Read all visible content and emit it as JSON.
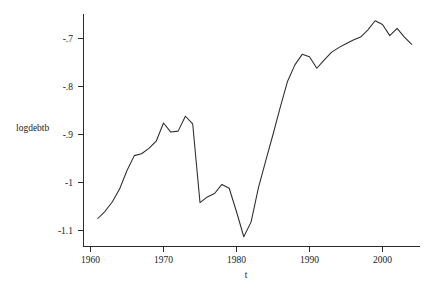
{
  "chart_data": {
    "type": "line",
    "title": "",
    "subtitle": "",
    "xlabel": "t",
    "ylabel": "logdebtb",
    "legend": [],
    "legend_position": "none",
    "grid": false,
    "xlim": [
      1960,
      2005
    ],
    "ylim": [
      -1.13,
      -0.655
    ],
    "xticks": [
      1960,
      1970,
      1980,
      1990,
      2000
    ],
    "xtick_labels": [
      "1960",
      "1970",
      "1980",
      "1990",
      "2000"
    ],
    "yticks": [
      -0.7,
      -0.8,
      -0.9,
      -1,
      -1.1
    ],
    "ytick_labels": [
      "-.7",
      "-.8",
      "-.9",
      "-1",
      "-1.1"
    ],
    "line_color": "#2b2b2b",
    "axis_color": "#2b2b2b",
    "background_color": "#ffffff",
    "series": [
      {
        "name": "logdebtb",
        "x": [
          1961,
          1962,
          1963,
          1964,
          1965,
          1966,
          1967,
          1968,
          1969,
          1970,
          1971,
          1972,
          1973,
          1974,
          1975,
          1976,
          1977,
          1978,
          1979,
          1980,
          1981,
          1982,
          1983,
          1984,
          1985,
          1986,
          1987,
          1988,
          1989,
          1990,
          1991,
          1992,
          1993,
          1994,
          1995,
          1996,
          1997,
          1998,
          1999,
          2000,
          2001,
          2002,
          2003,
          2004
        ],
        "values": [
          -1.075,
          -1.06,
          -1.04,
          -1.013,
          -0.975,
          -0.944,
          -0.94,
          -0.929,
          -0.914,
          -0.876,
          -0.895,
          -0.893,
          -0.862,
          -0.878,
          -1.042,
          -1.03,
          -1.023,
          -1.004,
          -1.012,
          -1.061,
          -1.113,
          -1.082,
          -1.011,
          -0.955,
          -0.9,
          -0.843,
          -0.789,
          -0.755,
          -0.733,
          -0.738,
          -0.762,
          -0.745,
          -0.729,
          -0.719,
          -0.711,
          -0.703,
          -0.697,
          -0.682,
          -0.663,
          -0.671,
          -0.694,
          -0.679,
          -0.697,
          -0.712
        ]
      }
    ]
  },
  "axis": {
    "y_title": "logdebtb",
    "x_title": "t"
  }
}
